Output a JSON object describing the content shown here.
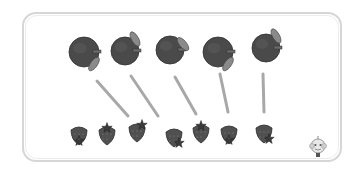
{
  "worksheet": {
    "task": "match apples to strawberries",
    "apples": [
      {
        "cx": 84,
        "cy": 52,
        "r": 15,
        "leaf": "bottom-right"
      },
      {
        "cx": 125,
        "cy": 51,
        "r": 14,
        "leaf": "top-right"
      },
      {
        "cx": 170,
        "cy": 50,
        "r": 14,
        "leaf": "right"
      },
      {
        "cx": 218,
        "cy": 52,
        "r": 15,
        "leaf": "bottom-right"
      },
      {
        "cx": 266,
        "cy": 48,
        "r": 14,
        "leaf": "top-right"
      }
    ],
    "strawberries": [
      {
        "cx": 79,
        "cy": 135,
        "calyx": "bottom"
      },
      {
        "cx": 107,
        "cy": 135,
        "calyx": "top"
      },
      {
        "cx": 137,
        "cy": 132,
        "calyx": "top-right"
      },
      {
        "cx": 174,
        "cy": 137,
        "calyx": "bottom-right"
      },
      {
        "cx": 201,
        "cy": 133,
        "calyx": "top"
      },
      {
        "cx": 229,
        "cy": 134,
        "calyx": "bottom"
      },
      {
        "cx": 264,
        "cy": 133,
        "calyx": "bottom-right"
      }
    ],
    "lines": [
      {
        "x1": 97,
        "y1": 81,
        "x2": 128,
        "y2": 116
      },
      {
        "x1": 131,
        "y1": 76,
        "x2": 158,
        "y2": 116
      },
      {
        "x1": 175,
        "y1": 77,
        "x2": 196,
        "y2": 114
      },
      {
        "x1": 220,
        "y1": 74,
        "x2": 228,
        "y2": 112
      },
      {
        "x1": 263,
        "y1": 74,
        "x2": 264,
        "y2": 112
      }
    ],
    "colors": {
      "apple": "#4a4a4a",
      "apple_shade": "#3a3a3a",
      "leaf": "#8a8a8a",
      "strawberry": "#505050",
      "line": "#a8a8a8",
      "frame": "#d6d6d6"
    },
    "mascot_icon": "monkey-mascot-icon"
  }
}
